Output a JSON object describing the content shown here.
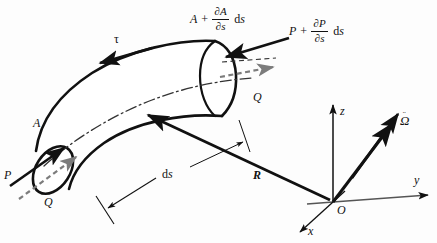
{
  "figure": {
    "background_color": "#fdfdfd",
    "ink_color": "#111111",
    "accent_gray": "#7c7c7c"
  },
  "labels": {
    "tau": "τ",
    "A_end": "A",
    "P_left": "P",
    "Q_left": "Q",
    "Q_right": "Q",
    "ds": "ds",
    "ds_prefix": "d",
    "ds_suffix": "s",
    "R_vector": "R",
    "origin": "O",
    "axis_x": "x",
    "axis_y": "y",
    "axis_z": "z",
    "omega_glyph": "Ω",
    "omega_dots": "¨",
    "omega_full": "Ω̈"
  },
  "expressions": {
    "area_increment": {
      "lead": "A",
      "operator": "+",
      "numerator": "∂A",
      "denominator": "∂s",
      "differential_prefix": "d",
      "differential_var": "s",
      "full": "A + ∂A/∂s ds"
    },
    "force_increment": {
      "lead": "P",
      "operator": "+",
      "numerator": "∂P",
      "denominator": "∂s",
      "differential_prefix": "d",
      "differential_var": "s",
      "full": "P + ∂P/∂s ds"
    }
  },
  "axes": {
    "origin_label": "O",
    "items": [
      {
        "name": "z",
        "label": "z",
        "direction": "up"
      },
      {
        "name": "y",
        "label": "y",
        "direction": "right"
      },
      {
        "name": "x",
        "label": "x",
        "direction": "down-left"
      }
    ]
  },
  "vectors": [
    {
      "name": "tau",
      "label": "τ",
      "style": "solid-black",
      "description": "torsion arrow on upper surface pointing left"
    },
    {
      "name": "P-left",
      "label": "P",
      "style": "solid-black",
      "description": "axial force arrow entering left end face"
    },
    {
      "name": "Q-left",
      "label": "Q",
      "style": "gray-dashed",
      "description": "shear force arrow at left end face"
    },
    {
      "name": "P-right",
      "label": "P + ∂P/∂s ds",
      "style": "solid-black",
      "description": "axial force arrow entering right end face"
    },
    {
      "name": "Q-right",
      "label": "Q",
      "style": "gray-dashed",
      "description": "shear force arrow leaving right end face"
    },
    {
      "name": "R",
      "label": "R",
      "style": "solid-black-bold",
      "description": "position vector from origin O to element"
    },
    {
      "name": "omega-ddot",
      "label": "Ω̈",
      "style": "solid-black-bold",
      "description": "angular acceleration vector at origin"
    }
  ],
  "annotations": [
    {
      "name": "ds",
      "label": "ds",
      "description": "arc length increment dimension with leader line"
    }
  ]
}
